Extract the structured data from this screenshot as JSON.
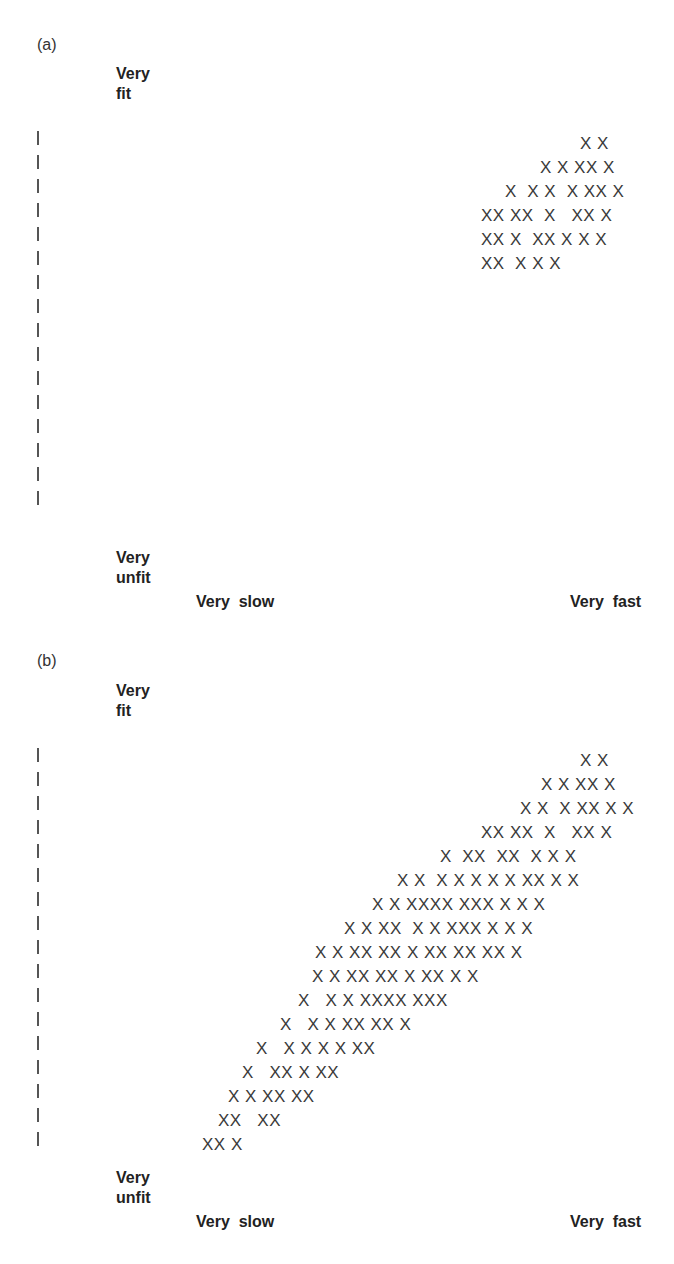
{
  "chart_data": [
    {
      "type": "scatter",
      "panel": "(a)",
      "title": "(a)",
      "ylabel_top": "Very fit",
      "ylabel_bottom": "Very unfit",
      "xlabel_left": "Very slow",
      "xlabel_right": "Very fast",
      "marker": "X",
      "y_tick_count": 16,
      "rows": [
        {
          "text": "X X",
          "x": 580,
          "y": 134
        },
        {
          "text": "X X XX X",
          "x": 540,
          "y": 158
        },
        {
          "text": "X  X X  X XX X",
          "x": 505,
          "y": 182
        },
        {
          "text": "XX XX  X   XX X",
          "x": 481,
          "y": 206
        },
        {
          "text": "XX X  XX X X X",
          "x": 481,
          "y": 230
        },
        {
          "text": "XX  X X X",
          "x": 481,
          "y": 254
        }
      ],
      "description": "Points clustered only in the top-right region: fast and fit"
    },
    {
      "type": "scatter",
      "panel": "(b)",
      "title": "(b)",
      "ylabel_top": "Very fit",
      "ylabel_bottom": "Very unfit",
      "xlabel_left": "Very slow",
      "xlabel_right": "Very fast",
      "marker": "X",
      "y_tick_count": 17,
      "rows": [
        {
          "text": "X X",
          "x": 580,
          "y": 751
        },
        {
          "text": "X X XX X",
          "x": 541,
          "y": 775
        },
        {
          "text": "X X  X XX X X",
          "x": 520,
          "y": 799
        },
        {
          "text": "XX XX  X   XX X",
          "x": 481,
          "y": 823
        },
        {
          "text": "X  XX  XX  X X X",
          "x": 440,
          "y": 847
        },
        {
          "text": "X X  X X X X X XX X X",
          "x": 397,
          "y": 871
        },
        {
          "text": "X X XXXX XXX X X X",
          "x": 372,
          "y": 895
        },
        {
          "text": "X X XX  X X XXX X X X",
          "x": 344,
          "y": 919
        },
        {
          "text": "X X XX XX X XX XX XX X",
          "x": 315,
          "y": 943
        },
        {
          "text": "X X XX XX X XX X X",
          "x": 312,
          "y": 967
        },
        {
          "text": "X   X X XXXX XXX",
          "x": 298,
          "y": 991
        },
        {
          "text": "X   X X XX XX X",
          "x": 280,
          "y": 1015
        },
        {
          "text": "X   X X X X XX",
          "x": 256,
          "y": 1039
        },
        {
          "text": "X   XX X XX",
          "x": 242,
          "y": 1063
        },
        {
          "text": "X X XX XX",
          "x": 228,
          "y": 1087
        },
        {
          "text": "XX   XX",
          "x": 218,
          "y": 1111
        },
        {
          "text": "XX X",
          "x": 202,
          "y": 1135
        }
      ],
      "description": "Points along a diagonal band from slow-unfit (bottom-left) to fast-fit (top-right)"
    }
  ],
  "panels": {
    "a": {
      "label": "(a)",
      "y_top": [
        "Very",
        "fit"
      ],
      "y_bottom": [
        "Very",
        "unfit"
      ],
      "x_left": "Very  slow",
      "x_right": "Very  fast"
    },
    "b": {
      "label": "(b)",
      "y_top": [
        "Very",
        "fit"
      ],
      "y_bottom": [
        "Very",
        "unfit"
      ],
      "x_left": "Very  slow",
      "x_right": "Very  fast"
    }
  }
}
